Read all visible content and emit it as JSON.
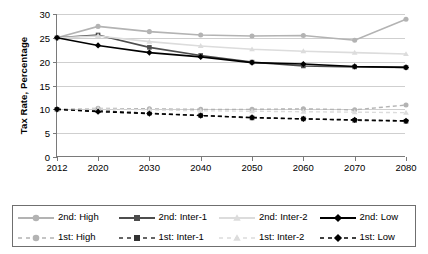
{
  "chart_data": {
    "type": "line",
    "title": "",
    "xlabel": "",
    "ylabel": "Tax Rate, Percentage",
    "ylim": [
      0,
      30
    ],
    "yticks": [
      0,
      5,
      10,
      15,
      20,
      25,
      30
    ],
    "grid": true,
    "legend_position": "bottom",
    "categories": [
      "2012",
      "2020",
      "2030",
      "2040",
      "2050",
      "2060",
      "2070",
      "2080"
    ],
    "x": [
      2012,
      2020,
      2030,
      2040,
      2050,
      2060,
      2070,
      2080
    ],
    "series": [
      {
        "name": "2nd: High",
        "color": "#b3b3b3",
        "marker": "circle",
        "dash": "solid",
        "values": [
          25.0,
          27.4,
          26.3,
          25.6,
          25.4,
          25.5,
          24.5,
          28.9
        ]
      },
      {
        "name": "2nd: Inter-1",
        "color": "#4d4d4d",
        "marker": "square",
        "dash": "solid",
        "values": [
          25.0,
          25.6,
          23.0,
          21.3,
          19.9,
          19.1,
          18.9,
          18.8
        ]
      },
      {
        "name": "2nd: Inter-2",
        "color": "#dcdcdc",
        "marker": "triangle",
        "dash": "solid",
        "values": [
          25.0,
          25.4,
          24.2,
          23.3,
          22.6,
          22.2,
          21.9,
          21.6
        ]
      },
      {
        "name": "2nd: Low",
        "color": "#000000",
        "marker": "diamond",
        "dash": "solid",
        "values": [
          25.0,
          23.4,
          21.9,
          21.0,
          19.8,
          19.5,
          19.0,
          18.8
        ]
      },
      {
        "name": "1st: High",
        "color": "#b3b3b3",
        "marker": "circle",
        "dash": "dashed",
        "values": [
          10.0,
          10.2,
          10.1,
          10.0,
          10.0,
          10.1,
          9.9,
          10.9
        ]
      },
      {
        "name": "1st: Inter-1",
        "color": "#333333",
        "marker": "square",
        "dash": "dashed",
        "values": [
          10.0,
          9.7,
          9.2,
          8.7,
          8.2,
          8.0,
          7.7,
          7.5
        ]
      },
      {
        "name": "1st: Inter-2",
        "color": "#dcdcdc",
        "marker": "triangle",
        "dash": "dashed",
        "values": [
          10.0,
          10.1,
          9.9,
          9.7,
          9.6,
          9.5,
          9.4,
          9.3
        ]
      },
      {
        "name": "1st: Low",
        "color": "#000000",
        "marker": "diamond",
        "dash": "dashed",
        "values": [
          10.0,
          9.5,
          9.1,
          8.7,
          8.3,
          8.0,
          7.8,
          7.6
        ]
      }
    ]
  },
  "axis": {
    "ylabel": "Tax Rate, Percentage",
    "yticks": [
      "0",
      "5",
      "10",
      "15",
      "20",
      "25",
      "30"
    ],
    "xticks": [
      "2012",
      "2020",
      "2030",
      "2040",
      "2050",
      "2060",
      "2070",
      "2080"
    ]
  },
  "legend": {
    "items": [
      {
        "label": "2nd: High"
      },
      {
        "label": "2nd: Inter-2"
      },
      {
        "label": "1st: High"
      },
      {
        "label": "1st: Inter-2"
      },
      {
        "label": "2nd: Inter-1"
      },
      {
        "label": "2nd: Low"
      },
      {
        "label": "1st: Inter-1"
      },
      {
        "label": "1st: Low"
      }
    ]
  }
}
